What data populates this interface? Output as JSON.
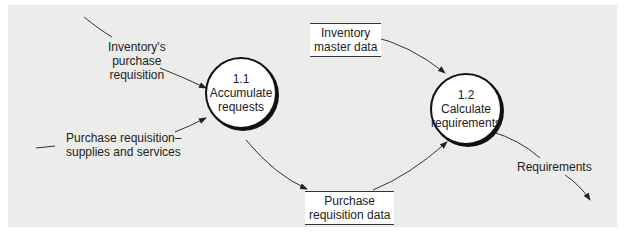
{
  "processes": [
    {
      "id": "1.1",
      "name": "Accumulate requests",
      "line1": "Accumulate",
      "line2": "requests"
    },
    {
      "id": "1.2",
      "name": "Calculate requirements",
      "line1": "Calculate",
      "line2": "requirements"
    }
  ],
  "data_stores": [
    {
      "line1": "Inventory",
      "line2": "master data"
    },
    {
      "line1": "Purchase",
      "line2": "requisition data"
    }
  ],
  "flows": [
    {
      "line1": "Inventory's",
      "line2": "purchase",
      "line3": "requisition"
    },
    {
      "line1": "Purchase requisition–",
      "line2": "supplies and services"
    },
    {
      "line1": "Requirements"
    }
  ],
  "colors": {
    "background": "#ececea",
    "stroke": "#111111"
  }
}
